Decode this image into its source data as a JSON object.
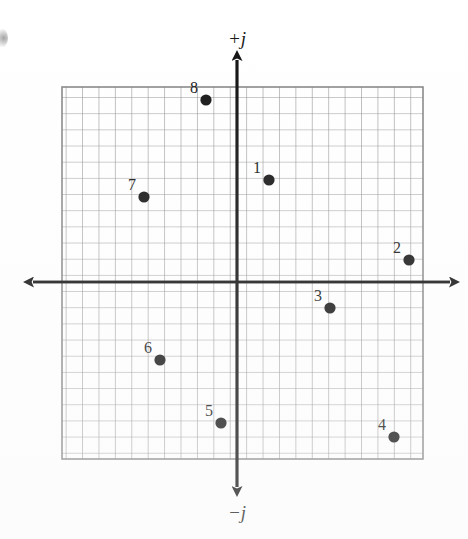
{
  "figure": {
    "type": "complex-plane-scatter",
    "corner_mark": "",
    "axis_labels": {
      "positive_imaginary": "+j",
      "negative_imaginary": "−j"
    }
  },
  "chart_data": {
    "type": "scatter",
    "title": "",
    "xlabel": "",
    "ylabel": "",
    "grid": true,
    "legend": "none",
    "axis_labels": {
      "top": "+j",
      "bottom": "−j"
    },
    "axis_style": "arrows-both-ends",
    "grid_cells_x": 22,
    "grid_cells_y": 23,
    "xlim": [
      -10.7,
      11.3
    ],
    "ylim": [
      -10.8,
      11.9
    ],
    "origin_cell_x": 10.7,
    "origin_cell_y": 11.9,
    "points": [
      {
        "label": "1",
        "px": 269,
        "py": 180,
        "x": 2.0,
        "y": 6.2
      },
      {
        "label": "2",
        "px": 409,
        "py": 260,
        "x": 10.5,
        "y": 1.3
      },
      {
        "label": "3",
        "px": 330,
        "py": 308,
        "x": 5.7,
        "y": -1.6
      },
      {
        "label": "4",
        "px": 394,
        "py": 437,
        "x": 9.6,
        "y": -9.5
      },
      {
        "label": "5",
        "px": 221,
        "py": 423,
        "x": -1.0,
        "y": -8.6
      },
      {
        "label": "6",
        "px": 160,
        "py": 360,
        "x": -4.7,
        "y": -4.8
      },
      {
        "label": "7",
        "px": 144,
        "py": 197,
        "x": -5.7,
        "y": 5.2
      },
      {
        "label": "8",
        "px": 206,
        "py": 100,
        "x": -1.9,
        "y": 11.1
      }
    ]
  }
}
